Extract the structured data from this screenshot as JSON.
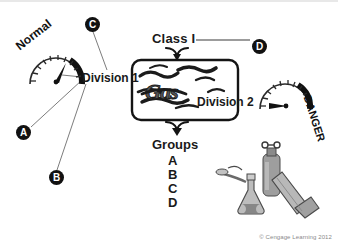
{
  "figure": {
    "copyright": "© Cengage Learning 2012",
    "background_color": "#ffffff"
  },
  "labels": {
    "class": "Class I",
    "division_1": "Division 1",
    "division_2": "Division 2",
    "groups_heading": "Groups",
    "center_box_text": "Gas"
  },
  "groups": [
    {
      "letter": "A"
    },
    {
      "letter": "B"
    },
    {
      "letter": "C"
    },
    {
      "letter": "D"
    }
  ],
  "gauges": [
    {
      "name": "normal-gauge",
      "label": "Normal",
      "needle_position": "low"
    },
    {
      "name": "danger-gauge",
      "label": "DANGER",
      "needle_position": "high"
    }
  ],
  "callouts": [
    {
      "id": "A",
      "label": "A"
    },
    {
      "id": "B",
      "label": "B"
    },
    {
      "id": "C",
      "label": "C"
    },
    {
      "id": "D",
      "label": "D"
    }
  ],
  "illustrations": [
    {
      "name": "gas-cylinder-icon"
    },
    {
      "name": "erlenmeyer-flask-icon"
    },
    {
      "name": "bunsen-burner-icon"
    }
  ],
  "colors": {
    "ink": "#1a1a1a",
    "marker_fill": "#111111",
    "marker_text": "#ffffff",
    "equipment_gray": "#9a9a9a",
    "copyright_gray": "#8a8a8a"
  }
}
